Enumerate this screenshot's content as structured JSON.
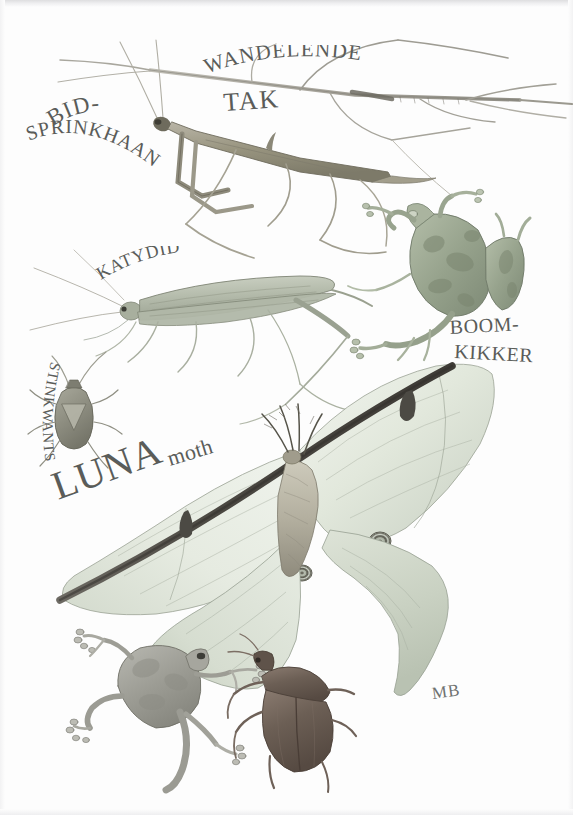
{
  "plate": {
    "title": "Camouflage in nature — pencil study plate",
    "background_color": "#fdfdfd",
    "ink_color": "#5a5c59",
    "signature": "MB",
    "width": 573,
    "height": 815
  },
  "labels": {
    "stick_insect_line1": "WANDELENDE",
    "stick_insect_line2": "TAK",
    "mantis_line1": "BID-",
    "mantis_line2": "SPRINKHAAN",
    "katydid": "KATYDID",
    "tree_frog_line1": "BOOM-",
    "tree_frog_line2": "KIKKER",
    "stink_bug": "STINKWANTS",
    "luna_caps": "LUNA",
    "luna_lower": "moth"
  },
  "subjects": [
    {
      "name": "walking-stick-insect",
      "label": "WANDELENDE TAK",
      "common_english": "walking stick",
      "color": "#b9b7ae"
    },
    {
      "name": "praying-mantis",
      "label": "BID-SPRINKHAAN",
      "common_english": "praying mantis",
      "color": "#9b9a8f"
    },
    {
      "name": "katydid",
      "label": "KATYDID",
      "common_english": "katydid",
      "color": "#b6bbac"
    },
    {
      "name": "tree-frog-upper",
      "label": "BOOM-KIKKER",
      "common_english": "tree frog",
      "color": "#9aa693"
    },
    {
      "name": "stink-bug",
      "label": "STINKWANTS",
      "common_english": "stink bug",
      "color": "#9a9b8e"
    },
    {
      "name": "luna-moth",
      "label": "LUNA moth",
      "common_english": "luna moth",
      "color": "#dfe6d8"
    },
    {
      "name": "tree-frog-lower",
      "label": "",
      "common_english": "tree frog",
      "color": "#a3a39c"
    },
    {
      "name": "beetle",
      "label": "",
      "common_english": "beetle",
      "color": "#6f6259"
    }
  ],
  "palette": {
    "paper": "#fdfdfd",
    "graphite": "#5a5c59",
    "moth_wing": "#e3e9de",
    "moth_wing_shadow": "#c3cbbd",
    "moth_costa": "#4a4642",
    "frog_green": "#99a58f",
    "frog_gray": "#a6a69e",
    "beetle_brown": "#6d6057",
    "stem_tan": "#b4b1a6",
    "katydid_green": "#b7bdae"
  }
}
